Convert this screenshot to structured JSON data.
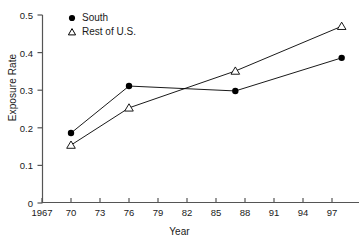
{
  "chart_data": {
    "type": "line",
    "title": "",
    "xlabel": "Year",
    "ylabel": "Exposure Rate",
    "xlim": [
      1967,
      1999
    ],
    "ylim": [
      0,
      0.5
    ],
    "grid": false,
    "legend_position": "top-left-inside",
    "x_tick_labels": [
      "1967",
      "70",
      "73",
      "76",
      "79",
      "82",
      "85",
      "88",
      "91",
      "94",
      "97"
    ],
    "x_tick_values": [
      1967,
      1970,
      1973,
      1976,
      1979,
      1982,
      1985,
      1988,
      1991,
      1994,
      1997
    ],
    "y_tick_labels": [
      "0",
      "0.1",
      "0.2",
      "0.3",
      "0.4",
      "0.5"
    ],
    "y_tick_values": [
      0,
      0.1,
      0.2,
      0.3,
      0.4,
      0.5
    ],
    "series": [
      {
        "name": "South",
        "marker": "filled-circle",
        "color": "#000000",
        "x": [
          1970,
          1976,
          1987,
          1998
        ],
        "values": [
          0.186,
          0.311,
          0.298,
          0.386
        ]
      },
      {
        "name": "Rest of U.S.",
        "marker": "open-triangle",
        "color": "#000000",
        "x": [
          1970,
          1976,
          1987,
          1998
        ],
        "values": [
          0.154,
          0.253,
          0.351,
          0.47
        ]
      }
    ]
  },
  "legend": {
    "items": [
      {
        "label": "South",
        "marker": "filled-circle"
      },
      {
        "label": "Rest of U.S.",
        "marker": "open-triangle"
      }
    ]
  },
  "axes": {
    "y_title": "Exposure Rate",
    "x_title": "Year"
  }
}
